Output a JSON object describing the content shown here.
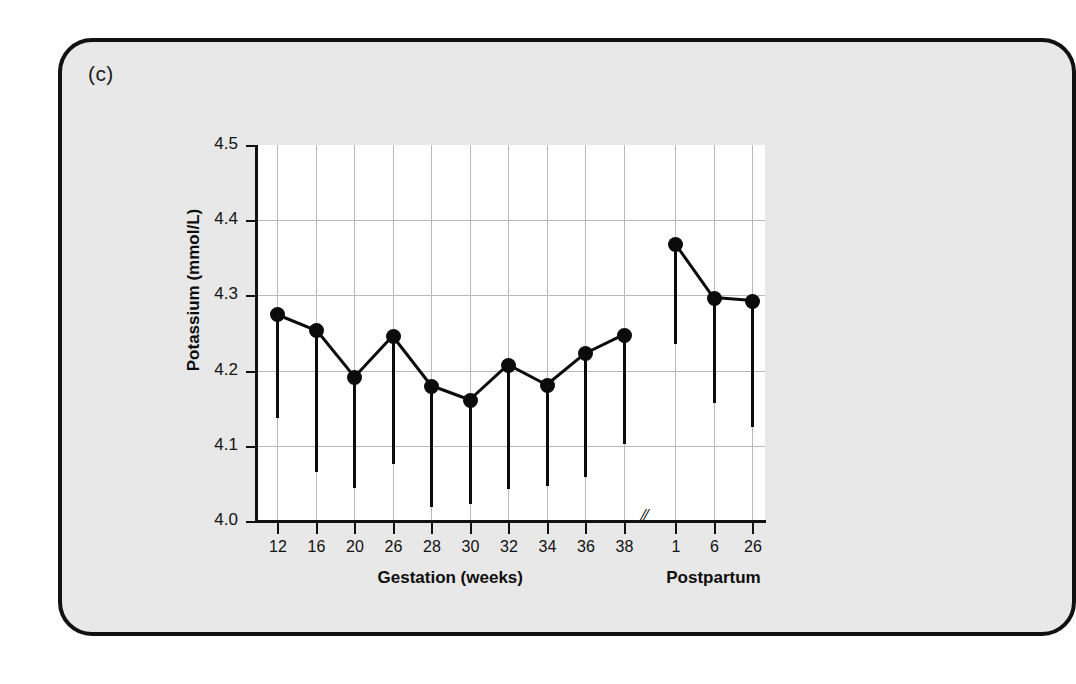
{
  "panel": {
    "label": "(c)",
    "background_color": "#e8e8e8",
    "border_color": "#111111"
  },
  "chart_data": {
    "type": "line",
    "title": "",
    "subtitle": "",
    "xlabel": "",
    "ylabel": "Potassium (mmol/L)",
    "ylim": [
      4.0,
      4.5
    ],
    "ytick_labels": [
      "4.0",
      "4.1",
      "4.2",
      "4.3",
      "4.4",
      "4.5"
    ],
    "ytick_values": [
      4.0,
      4.1,
      4.2,
      4.3,
      4.4,
      4.5
    ],
    "grid": true,
    "legend": "none",
    "axis_break": "//",
    "marker": "filled-circle",
    "error_bars": "lower-only",
    "groups": [
      {
        "name": "gestation",
        "axis_label": "Gestation (weeks)",
        "categories": [
          "12",
          "16",
          "20",
          "26",
          "28",
          "30",
          "32",
          "34",
          "36",
          "38"
        ],
        "values": [
          4.275,
          4.254,
          4.191,
          4.246,
          4.18,
          4.161,
          4.208,
          4.181,
          4.223,
          4.248
        ],
        "lower_bounds": [
          4.137,
          4.065,
          4.044,
          4.076,
          4.019,
          4.023,
          4.042,
          4.047,
          4.058,
          4.102
        ]
      },
      {
        "name": "postpartum",
        "axis_label": "Postpartum",
        "categories": [
          "1",
          "6",
          "26"
        ],
        "values": [
          4.369,
          4.297,
          4.293
        ],
        "lower_bounds": [
          4.236,
          4.157,
          4.125
        ]
      }
    ]
  }
}
